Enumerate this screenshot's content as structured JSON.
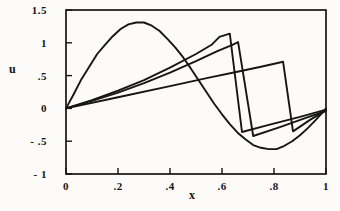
{
  "chart_data": {
    "type": "line",
    "title": "",
    "xlabel": "x",
    "ylabel": "u",
    "xlim": [
      0,
      1
    ],
    "ylim": [
      -1,
      1.5
    ],
    "grid": false,
    "legend": "none",
    "frame": "full-box",
    "line_color": "#161616",
    "background_color": "#fcfbf9",
    "x_ticks": [
      {
        "v": 0,
        "label": "0"
      },
      {
        "v": 0.2,
        "label": ".2"
      },
      {
        "v": 0.4,
        "label": ".4"
      },
      {
        "v": 0.6,
        "label": ".6"
      },
      {
        "v": 0.8,
        "label": ".8"
      },
      {
        "v": 1,
        "label": "1"
      }
    ],
    "y_ticks": [
      {
        "v": 1.5,
        "label": "1.5"
      },
      {
        "v": 1,
        "label": "1"
      },
      {
        "v": 0.5,
        "label": ".5"
      },
      {
        "v": 0,
        "label": "0"
      },
      {
        "v": -0.5,
        "label": "- .5"
      },
      {
        "v": -1,
        "label": "- 1"
      }
    ],
    "series": [
      {
        "name": "smooth-initial-wave",
        "points": [
          [
            0,
            0
          ],
          [
            0.03,
            0.22
          ],
          [
            0.06,
            0.45
          ],
          [
            0.09,
            0.64
          ],
          [
            0.12,
            0.83
          ],
          [
            0.15,
            0.97
          ],
          [
            0.18,
            1.1
          ],
          [
            0.21,
            1.21
          ],
          [
            0.24,
            1.28
          ],
          [
            0.27,
            1.31
          ],
          [
            0.3,
            1.31
          ],
          [
            0.33,
            1.26
          ],
          [
            0.36,
            1.18
          ],
          [
            0.39,
            1.06
          ],
          [
            0.42,
            0.93
          ],
          [
            0.45,
            0.78
          ],
          [
            0.48,
            0.61
          ],
          [
            0.51,
            0.43
          ],
          [
            0.54,
            0.25
          ],
          [
            0.57,
            0.07
          ],
          [
            0.6,
            -0.09
          ],
          [
            0.63,
            -0.24
          ],
          [
            0.66,
            -0.37
          ],
          [
            0.69,
            -0.47
          ],
          [
            0.72,
            -0.56
          ],
          [
            0.75,
            -0.6
          ],
          [
            0.78,
            -0.62
          ],
          [
            0.81,
            -0.62
          ],
          [
            0.84,
            -0.57
          ],
          [
            0.87,
            -0.5
          ],
          [
            0.9,
            -0.41
          ],
          [
            0.93,
            -0.3
          ],
          [
            0.96,
            -0.18
          ],
          [
            0.98,
            -0.09
          ],
          [
            1,
            0
          ]
        ]
      },
      {
        "name": "shock-profile-t1",
        "points": [
          [
            0,
            0
          ],
          [
            0.1,
            0.125
          ],
          [
            0.2,
            0.27
          ],
          [
            0.3,
            0.43
          ],
          [
            0.4,
            0.62
          ],
          [
            0.5,
            0.83
          ],
          [
            0.56,
            0.97
          ],
          [
            0.59,
            1.09
          ],
          [
            0.63,
            1.14
          ],
          [
            0.677,
            -0.36
          ],
          [
            0.78,
            -0.25
          ],
          [
            0.9,
            -0.13
          ],
          [
            1,
            -0.02
          ]
        ]
      },
      {
        "name": "shock-profile-t2",
        "points": [
          [
            0,
            0
          ],
          [
            0.1,
            0.115
          ],
          [
            0.2,
            0.24
          ],
          [
            0.3,
            0.385
          ],
          [
            0.4,
            0.545
          ],
          [
            0.5,
            0.72
          ],
          [
            0.58,
            0.87
          ],
          [
            0.64,
            0.97
          ],
          [
            0.662,
            1.01
          ],
          [
            0.72,
            -0.42
          ],
          [
            0.82,
            -0.29
          ],
          [
            0.92,
            -0.15
          ],
          [
            1,
            -0.04
          ]
        ]
      },
      {
        "name": "shock-profile-t3",
        "points": [
          [
            0,
            0
          ],
          [
            0.2,
            0.17
          ],
          [
            0.4,
            0.34
          ],
          [
            0.55,
            0.47
          ],
          [
            0.65,
            0.55
          ],
          [
            0.75,
            0.635
          ],
          [
            0.835,
            0.71
          ],
          [
            0.873,
            -0.35
          ],
          [
            0.94,
            -0.17
          ],
          [
            1,
            -0.03
          ]
        ]
      }
    ]
  }
}
